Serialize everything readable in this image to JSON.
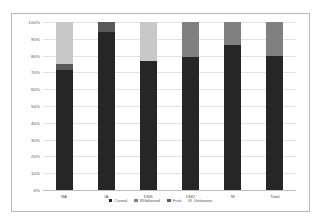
{
  "chart_data": {
    "type": "bar",
    "subtype": "100% stacked column",
    "title": "",
    "xlabel": "",
    "ylabel": "",
    "ylim": [
      0,
      100
    ],
    "ytick_labels": [
      "100%",
      "90%",
      "80%",
      "70%",
      "60%",
      "50%",
      "40%",
      "30%",
      "20%",
      "10%",
      "0%"
    ],
    "ytick_values": [
      100,
      90,
      80,
      70,
      60,
      50,
      40,
      30,
      20,
      10,
      0
    ],
    "grid": true,
    "legend_position": "bottom",
    "categories": [
      "BA",
      "IA",
      "DM1",
      "DM2",
      "M",
      "Total"
    ],
    "series": [
      {
        "name": "Cereal",
        "color": "#262626",
        "values": [
          71.5,
          94.0,
          77.0,
          79.0,
          86.5,
          80.0
        ]
      },
      {
        "name": "Wild/weed",
        "color": "#808080",
        "values": [
          0.0,
          0.0,
          0.0,
          21.0,
          13.5,
          20.0
        ]
      },
      {
        "name": "Fruit",
        "color": "#595959",
        "values": [
          3.5,
          6.0,
          0.0,
          0.0,
          0.0,
          0.0
        ]
      },
      {
        "name": "Unknown",
        "color": "#c8c8c8",
        "values": [
          25.0,
          0.0,
          23.0,
          0.0,
          0.0,
          0.0
        ]
      }
    ]
  },
  "legend": {
    "items": [
      {
        "label": "Cereal",
        "color": "#262626"
      },
      {
        "label": "Wild/weed",
        "color": "#808080"
      },
      {
        "label": "Fruit",
        "color": "#595959"
      },
      {
        "label": "Unknown",
        "color": "#c8c8c8"
      }
    ]
  }
}
